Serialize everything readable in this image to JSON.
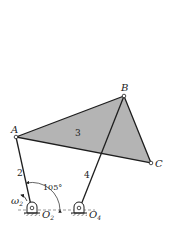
{
  "diagram": {
    "type": "four-bar linkage",
    "points": {
      "A": {
        "label": "A",
        "x": 16,
        "y": 137
      },
      "B": {
        "label": "B",
        "x": 124,
        "y": 96
      },
      "C": {
        "label": "C",
        "x": 151,
        "y": 163
      },
      "O2": {
        "label": "O",
        "sub": "2",
        "x": 32,
        "y": 210
      },
      "O4": {
        "label": "O",
        "sub": "4",
        "x": 79,
        "y": 210
      }
    },
    "links": [
      {
        "id": "2",
        "label": "2"
      },
      {
        "id": "3",
        "label": "3"
      },
      {
        "id": "4",
        "label": "4"
      }
    ],
    "angle_label": "105°",
    "omega": {
      "label": "ω",
      "sub": "2"
    },
    "colors": {
      "link3_fill": "#b4b4b4",
      "line": "#1e1e1e"
    }
  }
}
